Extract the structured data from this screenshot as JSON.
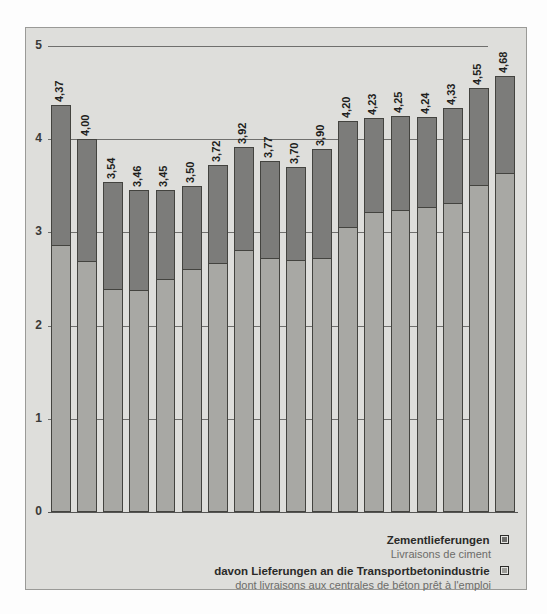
{
  "chart_data": {
    "type": "bar",
    "subtype": "overlapped-stacked",
    "title": "",
    "xlabel": "",
    "ylabel": "",
    "ylim": [
      0,
      5
    ],
    "yticks": [
      0,
      1,
      2,
      3,
      4,
      5
    ],
    "ytick_labels": [
      "0",
      "1",
      "2",
      "3",
      "4",
      "5"
    ],
    "grid": true,
    "grid_axis": "y",
    "legend_position": "bottom-right",
    "decimal_separator": ",",
    "categories": [
      "1994",
      "1995",
      "1996",
      "1997",
      "1998",
      "1999",
      "2000",
      "2001",
      "2002",
      "2003",
      "2004",
      "2005",
      "2006",
      "2007",
      "2008",
      "2009",
      "2010",
      "2011"
    ],
    "series": [
      {
        "name": "Zementlieferungen",
        "name_fr": "Livraisons de ciment",
        "color": "#7c7c7a",
        "values": [
          4.37,
          4.0,
          3.54,
          3.46,
          3.45,
          3.5,
          3.72,
          3.92,
          3.77,
          3.7,
          3.9,
          4.2,
          4.23,
          4.25,
          4.24,
          4.33,
          4.55,
          4.68
        ],
        "labels": [
          "4,37",
          "4,00",
          "3,54",
          "3,46",
          "3,45",
          "3,50",
          "3,72",
          "3,92",
          "3,77",
          "3,70",
          "3,90",
          "4,20",
          "4,23",
          "4,25",
          "4,24",
          "4,33",
          "4,55",
          "4,68"
        ]
      },
      {
        "name": "davon Lieferungen an die Transportbetonindustrie",
        "name_fr": "dont livraisons aux centrales de béton prêt à l'emploi",
        "color": "#a8a8a4",
        "values": [
          2.85,
          2.68,
          2.38,
          2.37,
          2.49,
          2.6,
          2.66,
          2.8,
          2.71,
          2.69,
          2.71,
          3.05,
          3.21,
          3.23,
          3.26,
          3.31,
          3.5,
          3.63
        ],
        "labels": [
          "2,85",
          "2,68",
          "2,38",
          "2,37",
          "2,49",
          "2,60",
          "2,66",
          "2,80",
          "2,71",
          "2,69",
          "2,71",
          "3,05",
          "3,21",
          "3,23",
          "3,26",
          "3,31",
          "3,50",
          "3,63"
        ]
      }
    ]
  },
  "legend": {
    "entries": [
      {
        "label_de": "Zementlieferungen",
        "label_fr": "Livraisons de ciment",
        "swatch": "dark"
      },
      {
        "label_de": "davon Lieferungen an die Transportbetonindustrie",
        "label_fr": "dont livraisons aux centrales de béton prêt à l'emploi",
        "swatch": "light"
      }
    ]
  },
  "colors": {
    "panel_background": "#dededb",
    "series_outer": "#7c7c7a",
    "series_inner": "#a8a8a4",
    "axis": "#555553",
    "gridline": "#6f6f6d",
    "label_dark": "#1f1f1d",
    "label_light": "#ffffff"
  }
}
